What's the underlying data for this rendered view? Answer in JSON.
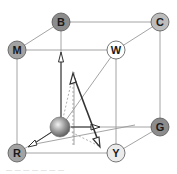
{
  "diagram": {
    "type": "color-cube",
    "nodes": [
      {
        "id": "B",
        "label": "B",
        "x": 61,
        "y": 22,
        "fill": "#8c8c8c"
      },
      {
        "id": "C",
        "label": "C",
        "x": 160,
        "y": 22,
        "fill": "#bdbdbd"
      },
      {
        "id": "M",
        "label": "M",
        "x": 17,
        "y": 50,
        "fill": "#a3a3a3"
      },
      {
        "id": "W",
        "label": "W",
        "x": 116,
        "y": 50,
        "fill": "#ffffff"
      },
      {
        "id": "G",
        "label": "G",
        "x": 160,
        "y": 127,
        "fill": "#8c8c8c"
      },
      {
        "id": "R",
        "label": "R",
        "x": 17,
        "y": 153,
        "fill": "#a3a3a3"
      },
      {
        "id": "Y",
        "label": "Y",
        "x": 116,
        "y": 153,
        "fill": "#ebebeb"
      }
    ],
    "origin_sphere": {
      "x": 60,
      "y": 127,
      "r": 10
    },
    "colors": {
      "edge": "#9a9a9a",
      "arrow": "#333333",
      "dashed": "#9a9a9a",
      "node_stroke": "#555555"
    },
    "caption": "— — — — — — —"
  }
}
